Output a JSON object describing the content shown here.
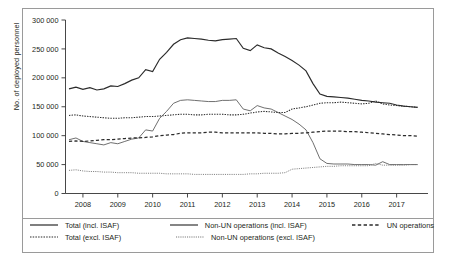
{
  "chart_data": {
    "type": "line",
    "title": "",
    "xlabel": "",
    "ylabel": "No. of deployed personnel",
    "xlim": [
      2007.5,
      2017.9
    ],
    "ylim": [
      0,
      300000
    ],
    "grid": false,
    "legend_position": "bottom",
    "x_ticks": [
      "2008",
      "2009",
      "2010",
      "2011",
      "2012",
      "2013",
      "2014",
      "2015",
      "2016",
      "2017"
    ],
    "x_tick_values": [
      2008,
      2009,
      2010,
      2011,
      2012,
      2013,
      2014,
      2015,
      2016,
      2017
    ],
    "y_ticks": [
      "0",
      "50 000",
      "100 000",
      "150 000",
      "200 000",
      "250 000",
      "300 000"
    ],
    "y_tick_values": [
      0,
      50000,
      100000,
      150000,
      200000,
      250000,
      300000
    ],
    "x": [
      2007.6,
      2007.8,
      2008.0,
      2008.2,
      2008.4,
      2008.6,
      2008.8,
      2009.0,
      2009.2,
      2009.4,
      2009.6,
      2009.8,
      2010.0,
      2010.2,
      2010.4,
      2010.6,
      2010.8,
      2011.0,
      2011.2,
      2011.4,
      2011.6,
      2011.8,
      2012.0,
      2012.2,
      2012.4,
      2012.6,
      2012.8,
      2013.0,
      2013.2,
      2013.4,
      2013.6,
      2013.8,
      2014.0,
      2014.2,
      2014.4,
      2014.6,
      2014.8,
      2015.0,
      2015.2,
      2015.4,
      2015.6,
      2015.8,
      2016.0,
      2016.2,
      2016.4,
      2016.6,
      2016.8,
      2017.0,
      2017.2,
      2017.4,
      2017.6
    ],
    "series": [
      {
        "name": "Total (incl. ISAF)",
        "style": "solid",
        "values": [
          181000,
          184000,
          180000,
          183000,
          179000,
          181000,
          186000,
          185000,
          190000,
          196000,
          200000,
          214000,
          211000,
          232000,
          244000,
          258000,
          266000,
          269000,
          268000,
          267000,
          265000,
          264000,
          266000,
          267000,
          268000,
          251000,
          247000,
          257000,
          252000,
          250000,
          243000,
          237000,
          230000,
          222000,
          212000,
          190000,
          172000,
          168000,
          167000,
          166000,
          165000,
          163000,
          161000,
          160000,
          158000,
          157000,
          156000,
          153000,
          151000,
          150000,
          149000
        ]
      },
      {
        "name": "Total (excl. ISAF)",
        "style": "dotted",
        "values": [
          135000,
          136000,
          134000,
          133000,
          132000,
          131000,
          130000,
          130000,
          131000,
          131000,
          132000,
          133000,
          133000,
          134000,
          135000,
          136000,
          137000,
          137000,
          136000,
          136000,
          137000,
          137000,
          137000,
          136000,
          136000,
          137000,
          139000,
          141000,
          142000,
          141000,
          140000,
          140000,
          146000,
          148000,
          150000,
          153000,
          156000,
          157000,
          157000,
          158000,
          157000,
          156000,
          155000,
          156000,
          160000,
          155000,
          153000,
          152000,
          151000,
          150000,
          149000
        ]
      },
      {
        "name": "Non-UN operations (incl. ISAF)",
        "style": "solid-thin",
        "values": [
          93000,
          96000,
          90000,
          88000,
          86000,
          84000,
          88000,
          86000,
          90000,
          94000,
          96000,
          110000,
          108000,
          130000,
          142000,
          156000,
          161000,
          162000,
          161000,
          160000,
          159000,
          159000,
          161000,
          161000,
          162000,
          146000,
          143000,
          152000,
          148000,
          146000,
          140000,
          134000,
          128000,
          120000,
          110000,
          88000,
          60000,
          52000,
          51000,
          51000,
          51000,
          50000,
          50000,
          50000,
          49000,
          55000,
          50000,
          50000,
          50000,
          50000,
          50000
        ]
      },
      {
        "name": "Non-UN operations (excl. ISAF)",
        "style": "dotted-thin",
        "values": [
          40000,
          41000,
          39000,
          38000,
          38000,
          37000,
          37000,
          36000,
          36000,
          36000,
          35000,
          35000,
          35000,
          35000,
          34000,
          34000,
          34000,
          34000,
          33000,
          33000,
          33000,
          33000,
          33000,
          33000,
          33000,
          33000,
          34000,
          34000,
          35000,
          35000,
          35000,
          36000,
          42000,
          43000,
          44000,
          45000,
          46000,
          47000,
          47000,
          48000,
          48000,
          48000,
          48000,
          48000,
          52000,
          49000,
          49000,
          49000,
          49000,
          50000,
          50000
        ]
      },
      {
        "name": "UN operations",
        "style": "dashed",
        "values": [
          90000,
          91000,
          90000,
          91000,
          92000,
          93000,
          93000,
          94000,
          95000,
          96000,
          96000,
          97000,
          98000,
          100000,
          101000,
          102000,
          104000,
          105000,
          105000,
          105000,
          106000,
          106000,
          105000,
          105000,
          105000,
          105000,
          105000,
          105000,
          104000,
          104000,
          103000,
          103000,
          104000,
          104000,
          105000,
          106000,
          107000,
          108000,
          108000,
          108000,
          107000,
          107000,
          106000,
          105000,
          104000,
          103000,
          102000,
          101000,
          100000,
          100000,
          99000
        ]
      }
    ]
  },
  "legend": {
    "items": [
      {
        "label": "Total (incl. ISAF)",
        "style": "solid"
      },
      {
        "label": "Total (excl. ISAF)",
        "style": "dotted"
      },
      {
        "label": "Non-UN operations (incl. ISAF)",
        "style": "solid-thin"
      },
      {
        "label": "Non-UN operations (excl. ISAF)",
        "style": "dotted-thin"
      },
      {
        "label": "UN operations",
        "style": "dashed"
      }
    ]
  }
}
